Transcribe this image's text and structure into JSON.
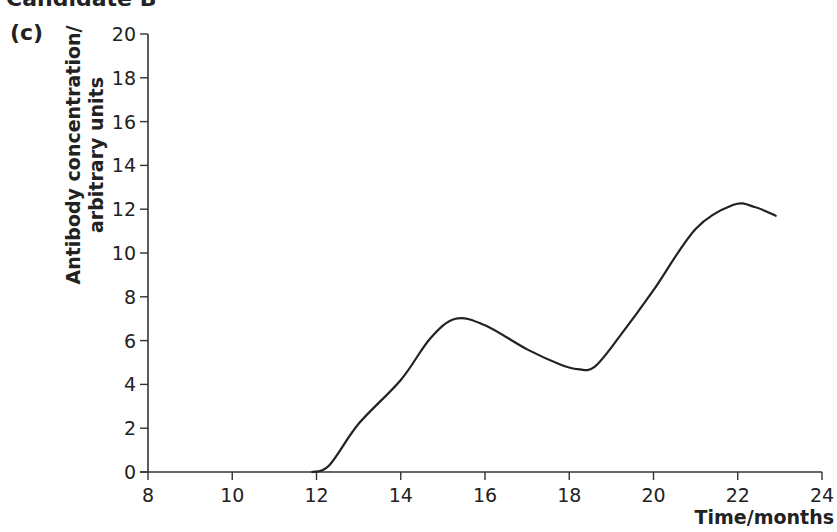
{
  "header": {
    "cut_title": "Candidate B",
    "panel_label": "(c)"
  },
  "chart_data": {
    "type": "line",
    "title": "",
    "xlabel": "Time/months",
    "ylabel_line1": "Antibody concentration/",
    "ylabel_line2": "arbitrary units",
    "xlim": [
      8,
      24
    ],
    "ylim": [
      0,
      20
    ],
    "x_ticks": [
      8,
      10,
      12,
      14,
      16,
      18,
      20,
      22,
      24
    ],
    "y_ticks": [
      0,
      2,
      4,
      6,
      8,
      10,
      12,
      14,
      16,
      18,
      20
    ],
    "grid": false,
    "legend": null,
    "series": [
      {
        "name": "Antibody concentration",
        "color": "#222222",
        "x": [
          8,
          11.9,
          12.3,
          13,
          14,
          14.7,
          15.3,
          16,
          17,
          17.8,
          18.2,
          18.6,
          19.2,
          20,
          21,
          21.9,
          22.4,
          22.9
        ],
        "y": [
          0,
          0,
          0.3,
          2.2,
          4.2,
          6.1,
          7.0,
          6.7,
          5.6,
          4.9,
          4.7,
          4.8,
          6.2,
          8.3,
          11.1,
          12.2,
          12.1,
          11.7
        ]
      }
    ]
  }
}
